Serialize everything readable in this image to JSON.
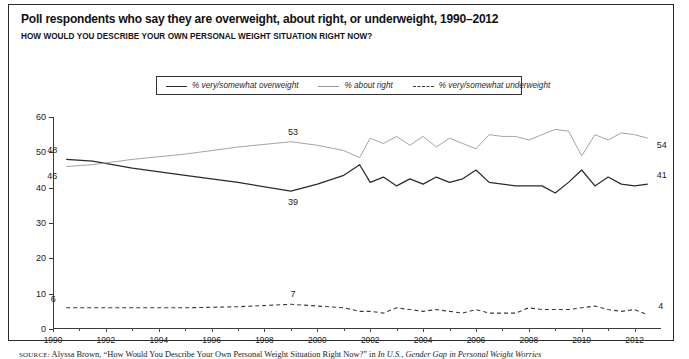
{
  "figure": {
    "title": "Poll respondents who say they are overweight, about right, or underweight, 1990–2012",
    "subtitle": "HOW WOULD YOU DESCRIBE YOUR OWN PERSONAL WEIGHT SITUATION RIGHT NOW?",
    "source_prefix": "SOURCE:",
    "source_text": " Alyssa Brown, “How Would You Describe Your Own Personal Weight Situation Right Now?” in ",
    "source_italic": "In U.S., Gender Gap in Personal Weight Worries"
  },
  "legend": {
    "items": [
      {
        "label": "% very/somewhat overweight",
        "style": "solid",
        "color": "#2b2b2b"
      },
      {
        "label": "% about right",
        "style": "thin",
        "color": "#9a9a9a"
      },
      {
        "label": "% very/somewhat underweight",
        "style": "dashed",
        "color": "#3a3a3a"
      }
    ]
  },
  "chart_data": {
    "type": "line",
    "title": "Poll respondents who say they are overweight, about right, or underweight, 1990–2012",
    "subtitle": "HOW WOULD YOU DESCRIBE YOUR OWN PERSONAL WEIGHT SITUATION RIGHT NOW?",
    "xlabel": "",
    "ylabel": "",
    "xlim": [
      1990,
      2013
    ],
    "ylim": [
      0,
      60
    ],
    "yticks": [
      0,
      10,
      20,
      30,
      40,
      50,
      60
    ],
    "xticks": [
      1990,
      1991,
      1992,
      1993,
      1994,
      1995,
      1996,
      1997,
      1998,
      1999,
      2000,
      2001,
      2002,
      2003,
      2004,
      2005,
      2006,
      2007,
      2008,
      2009,
      2010,
      2011,
      2012
    ],
    "xticklabels": [
      "1990",
      "",
      "1992",
      "",
      "1994",
      "",
      "1996",
      "",
      "1998",
      "",
      "2000",
      "",
      "2002",
      "",
      "2004",
      "",
      "2006",
      "",
      "2008",
      "",
      "2010",
      "",
      "2012"
    ],
    "grid": false,
    "legend_position": "top-center",
    "x": [
      1990.5,
      1991.5,
      1993,
      1995,
      1997,
      1999,
      2000,
      2001,
      2001.6,
      2002,
      2002.5,
      2003,
      2003.5,
      2004,
      2004.5,
      2005,
      2005.5,
      2006,
      2006.5,
      2007,
      2007.5,
      2008,
      2008.5,
      2009,
      2009.5,
      2010,
      2010.5,
      2011,
      2011.5,
      2012,
      2012.5
    ],
    "series": [
      {
        "name": "% very/somewhat overweight",
        "style": "solid",
        "color": "#2b2b2b",
        "values": [
          48,
          47.5,
          45.5,
          43.5,
          41.5,
          39,
          41,
          43.5,
          46.5,
          41.5,
          43,
          40.5,
          42.5,
          41,
          43,
          41.5,
          42.5,
          45,
          41.5,
          41,
          40.5,
          40.5,
          40.5,
          38.5,
          41.5,
          45,
          40.5,
          43,
          41,
          40.5,
          41
        ]
      },
      {
        "name": "% about right",
        "style": "thin",
        "color": "#9a9a9a",
        "values": [
          46,
          46.5,
          48,
          49.5,
          51.5,
          53,
          52,
          50.5,
          48.5,
          54,
          52.5,
          54.5,
          52,
          54.5,
          51.5,
          54,
          52.5,
          51,
          55,
          54.5,
          54.5,
          53.5,
          55,
          56.5,
          56,
          49,
          55,
          53.5,
          55.5,
          55,
          54
        ]
      },
      {
        "name": "% very/somewhat underweight",
        "style": "dashed",
        "color": "#3a3a3a",
        "values": [
          6,
          6,
          6,
          6,
          6.3,
          7,
          6.5,
          6,
          5,
          5,
          4.5,
          6,
          5.5,
          5,
          5.5,
          5,
          4.5,
          5.5,
          4.5,
          4.5,
          4.5,
          6,
          5.5,
          5.5,
          5.5,
          6,
          6.5,
          5.5,
          5,
          5.5,
          4
        ]
      }
    ],
    "annotations": [
      {
        "text": "48",
        "x": 1990.5,
        "y": 48,
        "dx": -14,
        "dy": -9,
        "series": "% very/somewhat overweight"
      },
      {
        "text": "46",
        "x": 1990.5,
        "y": 46,
        "dx": -14,
        "dy": 10,
        "series": "% about right"
      },
      {
        "text": "6",
        "x": 1990.5,
        "y": 6,
        "dx": -13,
        "dy": -9,
        "series": "% very/somewhat underweight"
      },
      {
        "text": "53",
        "x": 1999,
        "y": 53,
        "dx": 2,
        "dy": -10,
        "series": "% about right"
      },
      {
        "text": "39",
        "x": 1999,
        "y": 39,
        "dx": 2,
        "dy": 11,
        "series": "% very/somewhat overweight"
      },
      {
        "text": "7",
        "x": 1999,
        "y": 7,
        "dx": 2,
        "dy": -10,
        "series": "% very/somewhat underweight"
      },
      {
        "text": "54",
        "x": 2012.5,
        "y": 54,
        "dx": 14,
        "dy": 7,
        "series": "% about right"
      },
      {
        "text": "41",
        "x": 2012.5,
        "y": 41,
        "dx": 14,
        "dy": -9,
        "series": "% very/somewhat overweight"
      },
      {
        "text": "4",
        "x": 2012.5,
        "y": 4,
        "dx": 13,
        "dy": -9,
        "series": "% very/somewhat underweight"
      }
    ]
  }
}
